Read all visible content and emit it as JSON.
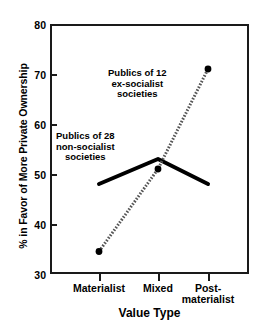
{
  "chart_data": {
    "type": "line",
    "title": "",
    "xlabel": "Value Type",
    "ylabel": "% in Favor of More Private Ownership",
    "categories": [
      "Materialist",
      "Mixed",
      "Post-materialist"
    ],
    "category_labels": [
      {
        "line1": "Materialist",
        "line2": ""
      },
      {
        "line1": "Mixed",
        "line2": ""
      },
      {
        "line1": "Post-",
        "line2": "materialist"
      }
    ],
    "ylim": [
      30,
      80
    ],
    "yticks": [
      30,
      40,
      50,
      60,
      70,
      80
    ],
    "ytick_labels": [
      "30",
      "40",
      "50",
      "60",
      "70",
      "80"
    ],
    "grid": false,
    "legend_position": "inline-annotations",
    "series": [
      {
        "name": "Publics of 28 non-socialist societies",
        "values": [
          48,
          53,
          48
        ],
        "style": "solid",
        "color": "#000000",
        "linewidth": 4,
        "markers": false
      },
      {
        "name": "Publics of 12 ex-socialist societies",
        "values": [
          34.5,
          51,
          71
        ],
        "style": "dotted",
        "color": "#555555",
        "linewidth": 3,
        "markers": true
      }
    ],
    "annotations": [
      {
        "id": "exsocialist",
        "lines": [
          "Publics of 12",
          "ex-socialist",
          "societies"
        ]
      },
      {
        "id": "nonsocialist",
        "lines": [
          "Publics of 28",
          "non-socialist",
          "societies"
        ]
      }
    ]
  },
  "colors": {
    "axis": "#1a1a1a",
    "solid_series": "#000000",
    "dotted_series": "#555555",
    "background": "#ffffff"
  }
}
